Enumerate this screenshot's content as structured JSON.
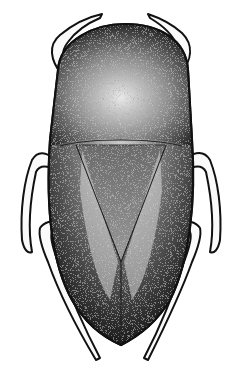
{
  "image": {
    "subject": "stippled dorsal-view illustration of an aquatic bug",
    "style": "black-and-white stipple engraving",
    "background": "#ffffff",
    "ink": "#111111",
    "parts": {
      "head_pronotum": "rounded pronotum with light central highlight",
      "scutellum": "triangular scutellum in center of back",
      "hemelytra": "wings meeting along midline, tapering to point",
      "legs": [
        "front-left",
        "front-right",
        "mid-left",
        "mid-right",
        "hind-left",
        "hind-right"
      ]
    }
  }
}
